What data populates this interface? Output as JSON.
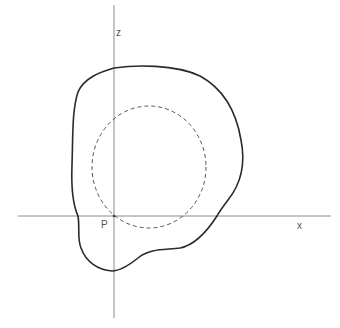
{
  "diagram": {
    "labels": {
      "z_axis": "z",
      "x_axis": "x",
      "origin": "P"
    },
    "colors": {
      "axis": "#8a8a8a",
      "boundary": "#2a2a2a",
      "circle": "#555555",
      "label": "#555555",
      "background": "#ffffff"
    },
    "axes": {
      "x_axis": {
        "x1": 18,
        "y1": 216,
        "x2": 331,
        "y2": 216
      },
      "z_axis": {
        "x1": 114,
        "y1": 5,
        "x2": 114,
        "y2": 318
      }
    },
    "origin_point": {
      "x": 114,
      "y": 216
    },
    "dashed_circle": {
      "cx": 149,
      "cy": 167,
      "rx": 57,
      "ry": 61
    },
    "blob_path": "M114,68 C135,65 175,64 200,76 C222,88 236,110 241,140 C246,165 240,185 228,200 C222,208 219,212 217,216 C208,230 195,245 180,248 C165,250 150,248 138,258 C128,266 120,271 112,271 C98,270 86,262 81,248 C77,238 80,228 78,216 C73,205 71,190 72,165 C73,135 72,110 78,92 C84,78 100,72 114,68 Z"
  }
}
